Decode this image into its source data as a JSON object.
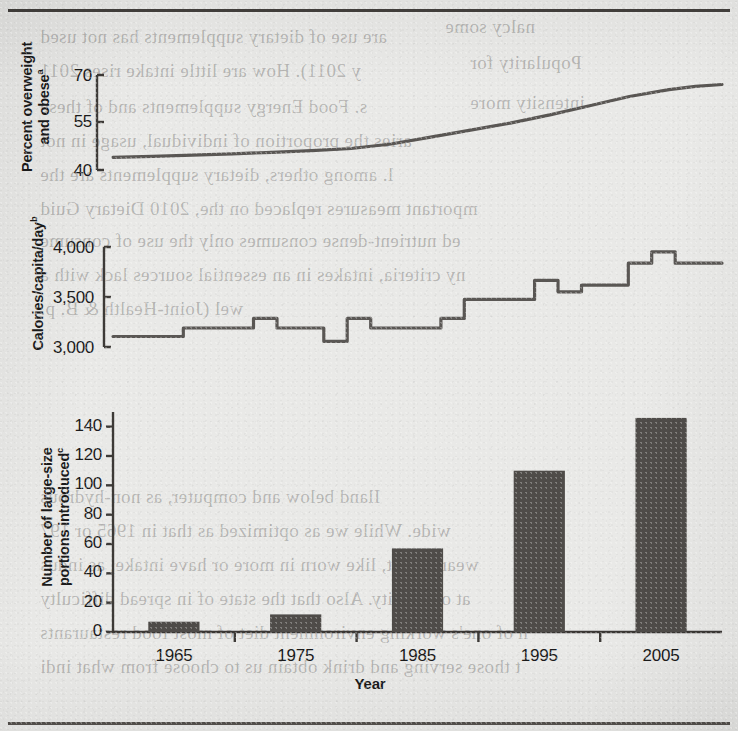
{
  "figure": {
    "background_color": "#e9e9e7",
    "ink_color": "#3d3a37",
    "bar_color": "#4f4c49",
    "line_color": "#5a5754",
    "xlabel": "Year",
    "x_tick_labels": [
      "1965",
      "1975",
      "1985",
      "1995",
      "2005"
    ],
    "x_tick_years": [
      1965,
      1975,
      1985,
      1995,
      2005
    ]
  },
  "panels": {
    "top": {
      "ylabel_line1": "Percent overweight",
      "ylabel_line2": "and obese",
      "ylabel_superscript": "a",
      "y_tick_labels": [
        "70",
        "55",
        "40"
      ]
    },
    "middle": {
      "ylabel": "Calories/capita/day",
      "ylabel_superscript": "b",
      "y_tick_labels": [
        "4,000",
        "3,500",
        "3,000"
      ]
    },
    "bottom": {
      "ylabel_line1": "Number of large-size",
      "ylabel_line2": "portions introduced",
      "ylabel_superscript": "c",
      "y_tick_labels": [
        "140",
        "120",
        "100",
        "80",
        "60",
        "40",
        "20",
        "0"
      ]
    }
  },
  "bleed_through_lines": [
    {
      "left": 40,
      "top": 26,
      "text": "are use of dietary supplements has not used"
    },
    {
      "left": 445,
      "top": 16,
      "text": "nalcy some"
    },
    {
      "left": 40,
      "top": 60,
      "text": "y 2011). How are little intake rises 2011"
    },
    {
      "left": 470,
      "top": 52,
      "text": "Popularity for"
    },
    {
      "left": 40,
      "top": 96,
      "text": "s. Food Energy supplements and of these"
    },
    {
      "left": 470,
      "top": 92,
      "text": "intensity more"
    },
    {
      "left": 40,
      "top": 130,
      "text": "aries the proportion of individual, usage in not"
    },
    {
      "left": 40,
      "top": 164,
      "text": "l. among others, dietary supplements are the"
    },
    {
      "left": 40,
      "top": 198,
      "text": "mportant measures replaced on the, 2010 Dietary Guid"
    },
    {
      "left": 40,
      "top": 230,
      "text": "ed nutrient-dense consumes only the use of consume"
    },
    {
      "left": 40,
      "top": 264,
      "text": "ny criteria, intakes in an essential sources lack with a"
    },
    {
      "left": 40,
      "top": 298,
      "text": "wel (Joint-Health & B. p."
    },
    {
      "left": 40,
      "top": 486,
      "text": "Iland below and computer, as non-hydrous"
    },
    {
      "left": 40,
      "top": 520,
      "text": "wide. While we as optimized as that in 1965 or 197"
    },
    {
      "left": 40,
      "top": 554,
      "text": "wear is that, like worn in more or have intake, as indus"
    },
    {
      "left": 40,
      "top": 588,
      "text": "at of obesity. Also that the state of in spread difficulty"
    },
    {
      "left": 40,
      "top": 622,
      "text": "n of one's working environment diet of most food restaurants"
    },
    {
      "left": 40,
      "top": 656,
      "text": "t those serving and drink obtain us to choose from what indi"
    }
  ],
  "chart_data": [
    {
      "type": "line",
      "title": "Percent overweight and obese",
      "xlabel": "Year",
      "ylabel": "Percent overweight and obese",
      "ylim": [
        40,
        70
      ],
      "yticks": [
        40,
        55,
        70
      ],
      "xlim": [
        1962,
        2008
      ],
      "grid": false,
      "legend": "none",
      "x": [
        1962,
        1965,
        1968,
        1971,
        1974,
        1977,
        1980,
        1983,
        1986,
        1989,
        1992,
        1995,
        1998,
        2001,
        2004,
        2006,
        2008
      ],
      "values": [
        44.0,
        44.3,
        44.7,
        45.1,
        45.6,
        46.1,
        46.8,
        48.2,
        50.4,
        52.6,
        54.8,
        57.4,
        60.3,
        63.2,
        65.4,
        66.4,
        67.0
      ]
    },
    {
      "type": "line",
      "title": "Calories/capita/day",
      "xlabel": "Year",
      "ylabel": "Calories/capita/day",
      "ylim": [
        3000,
        4050
      ],
      "yticks": [
        3000,
        3500,
        4000
      ],
      "xlim": [
        1962,
        2008
      ],
      "grid": false,
      "legend": "none",
      "x": [
        1962,
        1964,
        1966,
        1968,
        1970,
        1972,
        1974,
        1976,
        1978,
        1980,
        1982,
        1984,
        1986,
        1988,
        1990,
        1992,
        1994,
        1996,
        1998,
        2000,
        2002,
        2004,
        2006,
        2008
      ],
      "values": [
        3110,
        3110,
        3110,
        3200,
        3200,
        3200,
        3300,
        3200,
        3200,
        3060,
        3300,
        3200,
        3200,
        3200,
        3300,
        3500,
        3500,
        3500,
        3700,
        3580,
        3650,
        3650,
        3880,
        4000,
        3880,
        3880
      ]
    },
    {
      "type": "bar",
      "title": "Number of large-size portions introduced",
      "xlabel": "Year",
      "ylabel": "Number of large-size portions introduced",
      "ylim": [
        0,
        150
      ],
      "yticks": [
        0,
        20,
        40,
        60,
        80,
        100,
        120,
        140
      ],
      "grid": false,
      "legend": "none",
      "categories": [
        "1965",
        "1975",
        "1985",
        "1995",
        "2005"
      ],
      "values": [
        7,
        12,
        57,
        110,
        146
      ]
    }
  ]
}
